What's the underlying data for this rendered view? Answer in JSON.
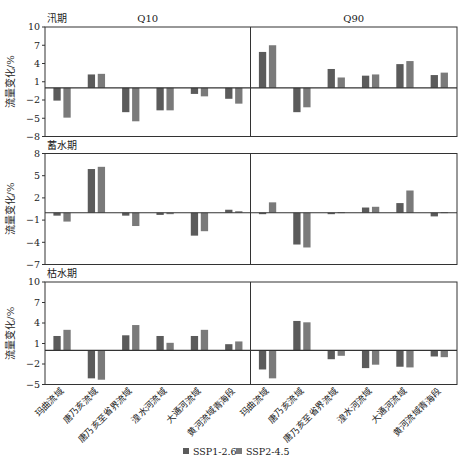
{
  "chart_data": {
    "type": "bar",
    "ylabel": "流量变化/%",
    "column_titles": [
      "Q10",
      "Q90"
    ],
    "categories": [
      "玛曲流域",
      "唐乃亥流域",
      "唐乃亥至省界流域",
      "湟水河流域",
      "大通河流域",
      "黄河流域青海段"
    ],
    "legend": [
      {
        "name": "SSP1-2.6",
        "color": "#5b5b5b"
      },
      {
        "name": "SSP2-4.5",
        "color": "#7a7a7a"
      }
    ],
    "legend_position": "bottom",
    "grid": false,
    "panels": [
      {
        "title": "汛期",
        "ylim": [
          -8,
          10
        ],
        "yticks": [
          10,
          7,
          4,
          1,
          -2,
          -5,
          -8
        ],
        "Q10": {
          "series": [
            {
              "name": "SSP1-2.6",
              "values": [
                -2.1,
                2.2,
                -4.0,
                -3.7,
                -1.0,
                -1.8
              ]
            },
            {
              "name": "SSP2-4.5",
              "values": [
                -4.9,
                2.3,
                -5.5,
                -3.7,
                -1.4,
                -2.6
              ]
            }
          ]
        },
        "Q90": {
          "series": [
            {
              "name": "SSP1-2.6",
              "values": [
                5.9,
                -4.0,
                3.1,
                2.0,
                3.9,
                2.1
              ]
            },
            {
              "name": "SSP2-4.5",
              "values": [
                7.0,
                -3.2,
                1.7,
                2.2,
                4.4,
                2.5
              ]
            }
          ]
        }
      },
      {
        "title": "蓄水期",
        "ylim": [
          -7,
          8
        ],
        "yticks": [
          8,
          5,
          2,
          -1,
          -4,
          -7
        ],
        "Q10": {
          "series": [
            {
              "name": "SSP1-2.6",
              "values": [
                -0.4,
                5.9,
                -0.4,
                -0.3,
                -3.1,
                0.4
              ]
            },
            {
              "name": "SSP2-4.5",
              "values": [
                -1.2,
                6.2,
                -1.8,
                -0.2,
                -2.5,
                0.2
              ]
            }
          ]
        },
        "Q90": {
          "series": [
            {
              "name": "SSP1-2.6",
              "values": [
                -0.2,
                -4.3,
                -0.2,
                0.7,
                1.3,
                -0.5
              ]
            },
            {
              "name": "SSP2-4.5",
              "values": [
                1.4,
                -4.7,
                0.05,
                0.8,
                3.0,
                0.05
              ]
            }
          ]
        }
      },
      {
        "title": "枯水期",
        "ylim": [
          -5,
          10
        ],
        "yticks": [
          10,
          7,
          4,
          1,
          -2,
          -5
        ],
        "Q10": {
          "series": [
            {
              "name": "SSP1-2.6",
              "values": [
                2.1,
                -4.1,
                2.2,
                2.1,
                2.1,
                0.9
              ]
            },
            {
              "name": "SSP2-4.5",
              "values": [
                3.0,
                -4.3,
                3.7,
                1.1,
                3.0,
                1.3
              ]
            }
          ]
        },
        "Q90": {
          "series": [
            {
              "name": "SSP1-2.6",
              "values": [
                -2.8,
                4.3,
                -1.3,
                -2.6,
                -2.4,
                -0.9
              ]
            },
            {
              "name": "SSP2-4.5",
              "values": [
                -4.1,
                4.1,
                -0.8,
                -2.1,
                -2.5,
                -1.0
              ]
            }
          ]
        }
      }
    ]
  },
  "layout_colors": {
    "axis": "#333333",
    "text": "#222222"
  }
}
